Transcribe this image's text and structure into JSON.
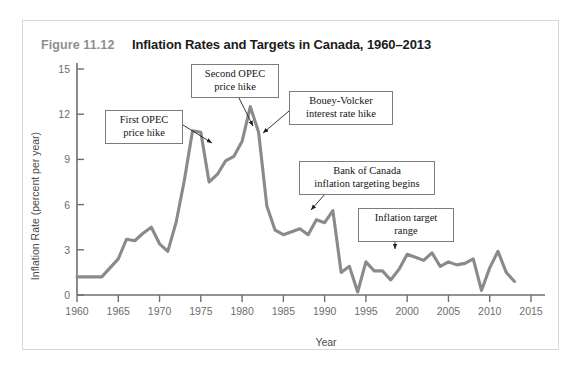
{
  "figure": {
    "number": "Figure 11.12",
    "title": "Inflation Rates and Targets in Canada, 1960–2013"
  },
  "annotations": [
    {
      "id": "first-opec",
      "line1": "First OPEC",
      "line2": "price hike"
    },
    {
      "id": "second-opec",
      "line1": "Second OPEC",
      "line2": "price hike"
    },
    {
      "id": "bouey-volcker",
      "line1": "Bouey-Volcker",
      "line2": "interest rate hike"
    },
    {
      "id": "bank-of-canada",
      "line1": "Bank of Canada",
      "line2": "inflation targeting begins"
    },
    {
      "id": "target-range",
      "line1": "Inflation target",
      "line2": "range"
    }
  ],
  "colors": {
    "line": "#8a8a8a",
    "axis": "#6f6f6f",
    "callout_border": "#7d7d7d",
    "card_border": "#d8d8d8",
    "figure_number": "#8e8e8e",
    "title": "#1b1b1b"
  },
  "chart_data": {
    "type": "line",
    "title": "Inflation Rates and Targets in Canada, 1960–2013",
    "xlabel": "Year",
    "ylabel": "Inflation Rate (percent per year)",
    "xlim": [
      1960,
      2015
    ],
    "ylim": [
      0,
      15
    ],
    "xticks": [
      1960,
      1965,
      1970,
      1975,
      1980,
      1985,
      1990,
      1995,
      2000,
      2005,
      2010,
      2015
    ],
    "yticks": [
      0,
      3,
      6,
      9,
      12,
      15
    ],
    "grid": false,
    "legend": "none",
    "series": [
      {
        "name": "Inflation rate",
        "x": [
          1960,
          1961,
          1962,
          1963,
          1964,
          1965,
          1966,
          1967,
          1968,
          1969,
          1970,
          1971,
          1972,
          1973,
          1974,
          1975,
          1976,
          1977,
          1978,
          1979,
          1980,
          1981,
          1982,
          1983,
          1984,
          1985,
          1986,
          1987,
          1988,
          1989,
          1990,
          1991,
          1992,
          1993,
          1994,
          1995,
          1996,
          1997,
          1998,
          1999,
          2000,
          2001,
          2002,
          2003,
          2004,
          2005,
          2006,
          2007,
          2008,
          2009,
          2010,
          2011,
          2012,
          2013
        ],
        "values": [
          1.2,
          1.2,
          1.2,
          1.2,
          1.8,
          2.4,
          3.7,
          3.6,
          4.1,
          4.5,
          3.4,
          2.9,
          4.8,
          7.6,
          10.9,
          10.8,
          7.5,
          8.0,
          8.9,
          9.2,
          10.2,
          12.5,
          10.8,
          5.9,
          4.3,
          4.0,
          4.2,
          4.4,
          4.0,
          5.0,
          4.8,
          5.6,
          1.5,
          1.9,
          0.2,
          2.2,
          1.6,
          1.6,
          1.0,
          1.7,
          2.7,
          2.5,
          2.3,
          2.8,
          1.9,
          2.2,
          2.0,
          2.1,
          2.4,
          0.3,
          1.8,
          2.9,
          1.5,
          0.9
        ]
      }
    ],
    "annotations": [
      {
        "text": "First OPEC price hike",
        "points_to_year": 1974,
        "points_to_value": 10.9
      },
      {
        "text": "Second OPEC price hike",
        "points_to_year": 1981,
        "points_to_value": 12.5
      },
      {
        "text": "Bouey-Volcker interest rate hike",
        "points_to_year": 1982,
        "points_to_value": 10.8
      },
      {
        "text": "Bank of Canada inflation targeting begins",
        "points_to_year": 1991,
        "points_to_value": 5.6
      },
      {
        "text": "Inflation target range",
        "points_to_year": 2000,
        "points_to_value": 2.7
      }
    ]
  }
}
